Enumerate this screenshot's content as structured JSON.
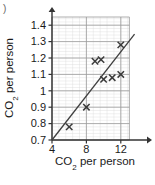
{
  "figure": {
    "corner_mark": ")",
    "axis_color": "#333333",
    "grid_major_color": "#9a9a9a",
    "grid_minor_color": "#d8d8d8",
    "marker_color": "#3a3a3a",
    "line_color": "#3f3f3f"
  },
  "chart_data": {
    "type": "scatter",
    "title": "",
    "xlabel": "CO2 per person",
    "ylabel": "CO2 per person",
    "xlabel_parts": {
      "pre": "CO",
      "sub": "2",
      "post": " per person"
    },
    "ylabel_parts": {
      "pre": "CO",
      "sub": "2",
      "post": " per person"
    },
    "xlim": [
      4,
      14
    ],
    "ylim": [
      0.7,
      1.45
    ],
    "xticks": [
      4,
      8,
      12
    ],
    "xtick_labels": [
      "4",
      "8",
      "12"
    ],
    "yticks": [
      0.7,
      0.8,
      0.9,
      1.0,
      1.1,
      1.2,
      1.3,
      1.4
    ],
    "ytick_labels": [
      "0.7",
      "0.8",
      "0.9",
      "1",
      "1.1",
      "1.2",
      "1.3",
      "1.4"
    ],
    "grid": true,
    "grid_minor": true,
    "minor_divisions": 5,
    "legend": null,
    "points": [
      {
        "x": 6.0,
        "y": 0.78
      },
      {
        "x": 8.0,
        "y": 0.9
      },
      {
        "x": 9.0,
        "y": 1.18
      },
      {
        "x": 9.7,
        "y": 1.19
      },
      {
        "x": 10.0,
        "y": 1.07
      },
      {
        "x": 11.0,
        "y": 1.08
      },
      {
        "x": 12.0,
        "y": 1.1
      },
      {
        "x": 12.0,
        "y": 1.28
      }
    ],
    "trend_line": {
      "x0": 4.0,
      "y0": 0.7,
      "x1": 13.6,
      "y1": 1.345
    },
    "marker": "x"
  }
}
